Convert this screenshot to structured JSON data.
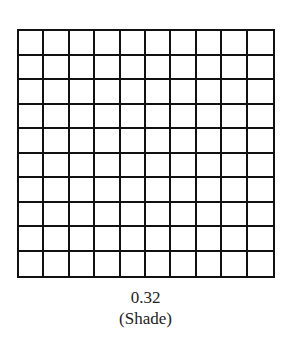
{
  "grid": {
    "rows": 10,
    "columns": 10,
    "shaded_cells": 0,
    "line_color": "#111111",
    "fill_color": "#ffffff"
  },
  "labels": {
    "value": "0.32",
    "instruction": "(Shade)"
  }
}
